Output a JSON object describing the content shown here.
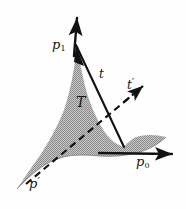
{
  "figure": {
    "background_color": "#fefefe",
    "ink_color": "#121212",
    "fill_color": "#a9a9a9",
    "labels": {
      "p1": {
        "base": "p",
        "sub": "1",
        "text": "p1"
      },
      "p0": {
        "base": "p",
        "sub": "0",
        "text": "p0"
      },
      "p_prime": {
        "base": "p",
        "prime": "′",
        "text": "p′"
      },
      "t": {
        "text": "t"
      },
      "t_prime": {
        "base": "t",
        "prime": "′",
        "text": "t′"
      },
      "region": {
        "text": "T"
      }
    },
    "elements": [
      {
        "name": "shaded-region-T",
        "kind": "filled-polygon",
        "label": "T"
      },
      {
        "name": "axis-arrow-p1",
        "kind": "solid-arrow",
        "label": "p1"
      },
      {
        "name": "axis-arrow-p0",
        "kind": "solid-arrow",
        "label": "p0"
      },
      {
        "name": "tangent-line-t",
        "kind": "solid-arrow",
        "label": "t"
      },
      {
        "name": "tangent-line-t-prime",
        "kind": "dashed-arrow",
        "label": "t′"
      },
      {
        "name": "dashed-ray-p-prime",
        "kind": "dashed-line",
        "label": "p′"
      }
    ]
  }
}
